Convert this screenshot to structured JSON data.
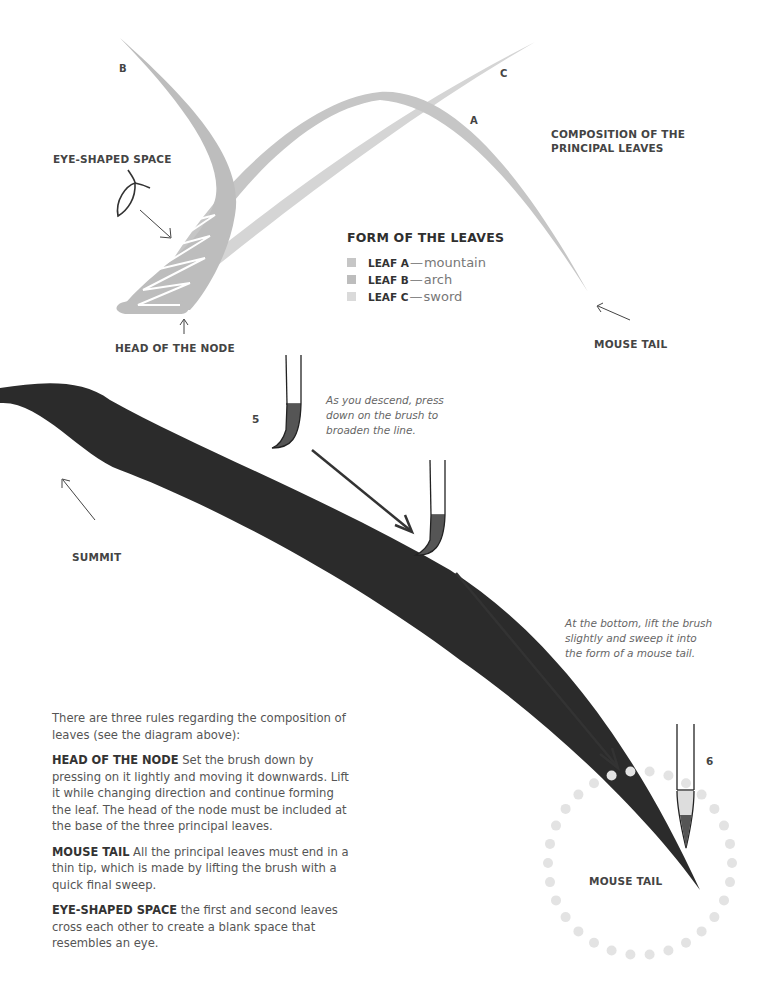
{
  "top_diagram": {
    "leaf_labels": {
      "a": "A",
      "b": "B",
      "c": "C"
    },
    "eye_shaped_space_label": "EYE-SHAPED SPACE",
    "head_of_node_label": "HEAD OF THE NODE",
    "composition_title_line1": "COMPOSITION OF THE",
    "composition_title_line2": "PRINCIPAL LEAVES",
    "mouse_tail_label": "MOUSE TAIL",
    "colors": {
      "leaf_a": "#c4c4c4",
      "leaf_b": "#bcbcbc",
      "leaf_c": "#d3d3d3"
    }
  },
  "legend": {
    "title": "FORM OF THE LEAVES",
    "items": [
      {
        "key": "LEAF A",
        "dash": "—",
        "name": "mountain",
        "color": "#c6c6c6"
      },
      {
        "key": "LEAF B",
        "dash": "—",
        "name": "arch",
        "color": "#bdbdbd"
      },
      {
        "key": "LEAF C",
        "dash": "—",
        "name": "sword",
        "color": "#dadada"
      }
    ]
  },
  "stroke_demo": {
    "step5": "5",
    "step6": "6",
    "caption_descend": [
      "As you descend, press",
      "down on the brush to",
      "broaden the line."
    ],
    "caption_bottom": [
      "At the bottom, lift the brush",
      "slightly and sweep it into",
      "the form of a mouse tail."
    ],
    "summit_label": "SUMMIT",
    "mouse_tail_label": "MOUSE TAIL",
    "ink_color": "#2b2b2b",
    "dot_color": "#e3e3e3"
  },
  "body": {
    "intro": "There are three rules regarding the composition of leaves (see the diagram above):",
    "rules": [
      {
        "term": "HEAD OF THE NODE",
        "text": " Set the brush down by pressing on it lightly and moving it downwards. Lift it while changing direction and continue forming the leaf. The head of the node must be included at the base of the three principal leaves."
      },
      {
        "term": "MOUSE TAIL",
        "text": " All the principal leaves must end in a thin tip, which is made by lifting the brush with a quick final sweep."
      },
      {
        "term": "EYE-SHAPED SPACE",
        "text": " the first and second leaves cross each other to create a blank space that resembles an eye."
      }
    ]
  }
}
